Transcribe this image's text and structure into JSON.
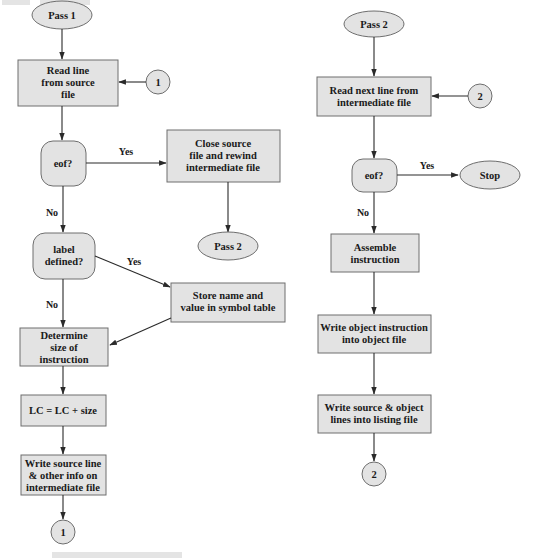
{
  "diagram": {
    "colors": {
      "node_fill": "#e3e3e3",
      "node_stroke": "#6e6e6e",
      "edge": "#2a2a2a",
      "text": "#1a1a1a"
    },
    "pass1": {
      "start": {
        "label": "Pass 1",
        "shape": "ellipse"
      },
      "read_line": {
        "lines": [
          "Read line",
          "from source",
          "file"
        ],
        "shape": "rect"
      },
      "connector_in": {
        "label": "1",
        "shape": "circle"
      },
      "eof": {
        "label": "eof?",
        "shape": "rounded"
      },
      "eof_yes": "Yes",
      "eof_no": "No",
      "close_source": {
        "lines": [
          "Close  source",
          "file and rewind",
          "intermediate file"
        ],
        "shape": "rect"
      },
      "goto_pass2": {
        "label": "Pass 2",
        "shape": "ellipse"
      },
      "label_defined": {
        "lines": [
          "label",
          "defined?"
        ],
        "shape": "rounded"
      },
      "label_yes": "Yes",
      "label_no": "No",
      "store_name": {
        "lines": [
          "Store name and",
          "value in symbol table"
        ],
        "shape": "rect"
      },
      "determine_size": {
        "lines": [
          "Determine",
          "size of",
          "instruction"
        ],
        "shape": "rect"
      },
      "lc_update": {
        "label": "LC = LC + size",
        "shape": "rect"
      },
      "write_source": {
        "lines": [
          "Write source line",
          "& other info on",
          "intermediate file"
        ],
        "shape": "rect"
      },
      "connector_out": {
        "label": "1",
        "shape": "circle"
      }
    },
    "pass2": {
      "start": {
        "label": "Pass 2",
        "shape": "ellipse"
      },
      "read_next": {
        "lines": [
          "Read next line from",
          "intermediate file"
        ],
        "shape": "rect"
      },
      "connector_in": {
        "label": "2",
        "shape": "circle"
      },
      "eof": {
        "label": "eof?",
        "shape": "rounded"
      },
      "eof_yes": "Yes",
      "eof_no": "No",
      "stop": {
        "label": "Stop",
        "shape": "ellipse"
      },
      "assemble": {
        "lines": [
          "Assemble",
          "instruction"
        ],
        "shape": "rect"
      },
      "write_object": {
        "lines": [
          "Write object instruction",
          "into object file"
        ],
        "shape": "rect"
      },
      "write_listing": {
        "lines": [
          "Write source & object",
          "lines into listing file"
        ],
        "shape": "rect"
      },
      "connector_out": {
        "label": "2",
        "shape": "circle"
      }
    }
  }
}
